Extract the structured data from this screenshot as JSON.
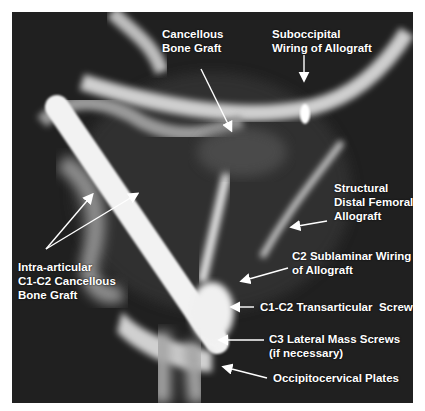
{
  "figure": {
    "background_color": "#1c1c1c",
    "label_color": "#ffffff"
  },
  "labels": {
    "cancellous_bone_graft": "Cancellous\nBone Graft",
    "suboccipital_wiring": "Suboccipital\nWiring of Allograft",
    "structural_allograft": "Structural\nDistal Femoral\nAllograft",
    "c2_sublaminar_wiring": "C2 Sublaminar Wiring\nof Allograft",
    "intra_articular_graft": "Intra-articular\nC1-C2 Cancellous\nBone Graft",
    "transarticular_screws": "C1-C2 Transarticular  Screws",
    "lateral_mass_screws": "C3 Lateral Mass Screws\n(if necessary)",
    "occipitocervical_plates": "Occipitocervical Plates"
  }
}
